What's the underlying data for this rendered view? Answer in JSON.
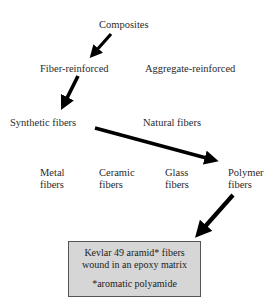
{
  "nodes": {
    "composites": "Composites",
    "fiber_reinforced": "Fiber-reinforced",
    "aggregate_reinforced": "Aggregate-reinforced",
    "synthetic_fibers": "Synthetic fibers",
    "natural_fibers": "Natural fibers",
    "metal": {
      "line1": "Metal",
      "line2": "fibers"
    },
    "ceramic": {
      "line1": "Ceramic",
      "line2": "fibers"
    },
    "glass": {
      "line1": "Glass",
      "line2": "fibers"
    },
    "polymer": {
      "line1": "Polymer",
      "line2": "fibers"
    }
  },
  "result_box": {
    "line1": "Kevlar 49 aramid* fibers",
    "line2": "wound in an epoxy matrix",
    "footnote": "*aromatic polyamide",
    "fill_color": "#d6d6d6"
  },
  "arrows": [
    {
      "from": "Composites",
      "to": "Fiber-reinforced"
    },
    {
      "from": "Fiber-reinforced",
      "to": "Synthetic fibers"
    },
    {
      "from": "Synthetic fibers",
      "to": "Polymer fibers"
    },
    {
      "from": "Polymer fibers",
      "to": "Kevlar 49 aramid fibers wound in an epoxy matrix"
    }
  ]
}
